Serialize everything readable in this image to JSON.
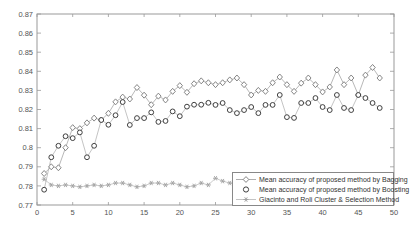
{
  "chart_data": {
    "type": "line",
    "title": "",
    "xlabel": "",
    "ylabel": "",
    "xlim": [
      0,
      50
    ],
    "ylim": [
      0.77,
      0.87
    ],
    "grid": false,
    "legend_position": "inside-bottom-right",
    "axis_color": "#999999",
    "x_ticks": [
      0,
      5,
      10,
      15,
      20,
      25,
      30,
      35,
      40,
      45,
      50
    ],
    "x_tick_labels": [
      "0",
      "5",
      "10",
      "15",
      "20",
      "25",
      "30",
      "35",
      "40",
      "45",
      "50"
    ],
    "y_ticks": [
      0.77,
      0.78,
      0.79,
      0.8,
      0.81,
      0.82,
      0.83,
      0.84,
      0.85,
      0.86,
      0.87
    ],
    "y_tick_labels": [
      "0.77",
      "0.78",
      "0.79",
      "0.8",
      "0.81",
      "0.82",
      "0.83",
      "0.84",
      "0.85",
      "0.86",
      "0.87"
    ],
    "x": [
      1,
      2,
      3,
      4,
      5,
      6,
      7,
      8,
      9,
      10,
      11,
      12,
      13,
      14,
      15,
      16,
      17,
      18,
      19,
      20,
      21,
      22,
      23,
      24,
      25,
      26,
      27,
      28,
      29,
      30,
      31,
      32,
      33,
      34,
      35,
      36,
      37,
      38,
      39,
      40,
      41,
      42,
      43,
      44,
      45,
      46,
      47,
      48
    ],
    "draw_order": [
      2,
      0,
      1
    ],
    "series": [
      {
        "id": "bagging",
        "name": "Mean accuracy of proposed method by Bagging",
        "marker": "diamond",
        "line_color": "#9a9a9a",
        "marker_color": "#787878",
        "values": [
          0.7865,
          0.79,
          0.7895,
          0.8,
          0.8105,
          0.81,
          0.813,
          0.8155,
          0.8145,
          0.818,
          0.824,
          0.8265,
          0.8255,
          0.8315,
          0.8275,
          0.8225,
          0.827,
          0.825,
          0.8295,
          0.8325,
          0.829,
          0.8335,
          0.835,
          0.834,
          0.833,
          0.834,
          0.8355,
          0.8365,
          0.833,
          0.8276,
          0.83,
          0.8295,
          0.834,
          0.837,
          0.833,
          0.8295,
          0.8338,
          0.8365,
          0.833,
          0.8292,
          0.8318,
          0.8407,
          0.833,
          0.8365,
          0.8276,
          0.838,
          0.842,
          0.8365
        ]
      },
      {
        "id": "boosting",
        "name": "Mean accuracy of proposed method by Boosting",
        "marker": "circle",
        "line_color": "#ababab",
        "marker_color": "#3f3f3f",
        "values": [
          0.778,
          0.795,
          0.801,
          0.806,
          0.805,
          0.808,
          0.795,
          0.801,
          0.8145,
          0.812,
          0.817,
          0.8239,
          0.8119,
          0.8155,
          0.8155,
          0.8185,
          0.8135,
          0.814,
          0.819,
          0.8165,
          0.8215,
          0.8225,
          0.8225,
          0.8235,
          0.8224,
          0.8234,
          0.8197,
          0.8181,
          0.8197,
          0.8213,
          0.8181,
          0.8224,
          0.8224,
          0.8276,
          0.816,
          0.8156,
          0.8234,
          0.8234,
          0.826,
          0.8213,
          0.8197,
          0.8276,
          0.8208,
          0.8197,
          0.8276,
          0.826,
          0.8234,
          0.8208
        ]
      },
      {
        "id": "giacinto",
        "name": "Giacinto and Roli Cluster & Selection Method",
        "marker": "asterisk",
        "line_color": "#b5b5b5",
        "marker_color": "#a2a2a2",
        "values": [
          0.7835,
          0.7805,
          0.78,
          0.7805,
          0.78,
          0.7795,
          0.78,
          0.7805,
          0.78,
          0.7805,
          0.7815,
          0.7815,
          0.7805,
          0.7795,
          0.78,
          0.7815,
          0.7815,
          0.7805,
          0.7815,
          0.7805,
          0.7795,
          0.78,
          0.7815,
          0.7805,
          0.784,
          0.7825,
          0.7815,
          0.781,
          0.781,
          0.781,
          0.781,
          0.781,
          0.781,
          0.781,
          0.781,
          0.781,
          0.781,
          0.781,
          0.781,
          0.781,
          0.781,
          0.781,
          0.781,
          0.781,
          0.781,
          0.781,
          0.781,
          0.781
        ]
      }
    ]
  }
}
